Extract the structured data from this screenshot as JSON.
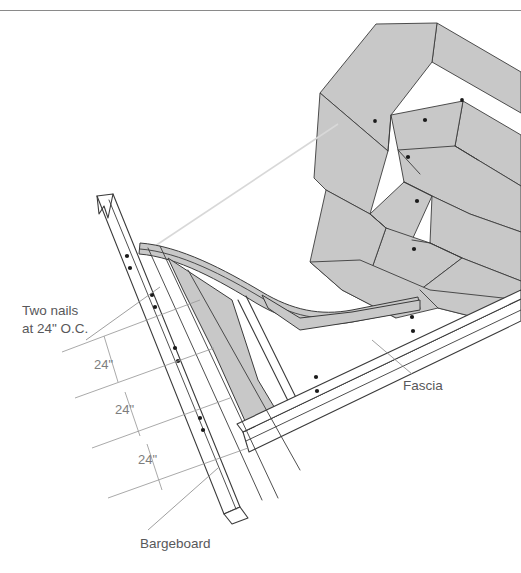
{
  "figure": {
    "type": "architectural-detail-drawing",
    "background_color": "#ffffff",
    "line_color": "#3b3b3b",
    "shingle_fill": "#c8c8c8",
    "board_fill": "#ffffff",
    "text_color": "#58585a",
    "dim_color": "#7d7d7d",
    "guide_color": "#d8d8d8",
    "rule_color": "#8a8a8a"
  },
  "annotations": {
    "note": {
      "line1": "Two nails",
      "line2": "at 24\" O.C."
    },
    "dimensions": [
      {
        "id": "dim-1",
        "label": "24\""
      },
      {
        "id": "dim-2",
        "label": "24\""
      },
      {
        "id": "dim-3",
        "label": "24\""
      }
    ],
    "parts": [
      {
        "id": "bargeboard",
        "label": "Bargeboard"
      },
      {
        "id": "fascia",
        "label": "Fascia"
      }
    ]
  },
  "components": {
    "bargeboard": {
      "name": "Bargeboard",
      "nail_pairs": 4
    },
    "fascia": {
      "name": "Fascia",
      "nail_pairs": 2
    },
    "shingles": {
      "name": "Roof shingles",
      "courses": 5,
      "nails_visible": 6
    },
    "drip_edge": {
      "name": "Curved drip edge / rake trim"
    },
    "rafter_tail": {
      "name": "Rafter tail"
    }
  }
}
